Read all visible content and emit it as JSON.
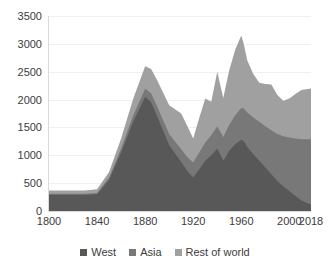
{
  "chart_data": {
    "type": "area",
    "stacked": true,
    "title": "",
    "xlabel": "",
    "ylabel": "",
    "ylim": [
      0,
      3500
    ],
    "ytick_values": [
      0,
      500,
      1000,
      1500,
      2000,
      2500,
      3000,
      3500
    ],
    "ytick_labels": [
      "0",
      "500",
      "1000",
      "1500",
      "2000",
      "2500",
      "3000",
      "3500"
    ],
    "xlim": [
      1800,
      2018
    ],
    "xtick_values": [
      1800,
      1840,
      1880,
      1920,
      1960,
      2000,
      2018
    ],
    "xtick_labels": [
      "1800",
      "1840",
      "1880",
      "1920",
      "1960",
      "2000",
      "2018"
    ],
    "grid": true,
    "legend_position": "bottom",
    "x": [
      1800,
      1810,
      1820,
      1830,
      1840,
      1850,
      1860,
      1870,
      1880,
      1885,
      1890,
      1900,
      1910,
      1915,
      1920,
      1925,
      1930,
      1935,
      1940,
      1945,
      1950,
      1955,
      1960,
      1962,
      1965,
      1970,
      1975,
      1980,
      1985,
      1990,
      1995,
      2000,
      2005,
      2010,
      2018
    ],
    "series": [
      {
        "name": "West",
        "color": "#585858",
        "values": [
          290,
          290,
          290,
          290,
          300,
          560,
          1050,
          1600,
          2050,
          1950,
          1700,
          1180,
          880,
          720,
          600,
          750,
          900,
          1000,
          1120,
          900,
          1080,
          1200,
          1280,
          1250,
          1150,
          1020,
          900,
          780,
          660,
          540,
          440,
          360,
          270,
          190,
          110
        ]
      },
      {
        "name": "Asia",
        "color": "#787878",
        "values": [
          20,
          20,
          20,
          20,
          25,
          40,
          70,
          110,
          150,
          160,
          175,
          200,
          230,
          250,
          270,
          300,
          330,
          360,
          400,
          430,
          470,
          520,
          570,
          590,
          620,
          660,
          700,
          740,
          790,
          840,
          900,
          960,
          1030,
          1100,
          1180
        ]
      },
      {
        "name": "Rest of world",
        "color": "#a0a0a0",
        "values": [
          60,
          60,
          60,
          60,
          65,
          100,
          180,
          300,
          400,
          440,
          470,
          520,
          640,
          560,
          430,
          620,
          790,
          600,
          980,
          700,
          980,
          1180,
          1300,
          1160,
          930,
          780,
          700,
          760,
          820,
          700,
          640,
          700,
          800,
          880,
          910
        ]
      }
    ],
    "legend": [
      {
        "label": "West",
        "color": "#585858"
      },
      {
        "label": "Asia",
        "color": "#787878"
      },
      {
        "label": "Rest of world",
        "color": "#a0a0a0"
      }
    ]
  }
}
